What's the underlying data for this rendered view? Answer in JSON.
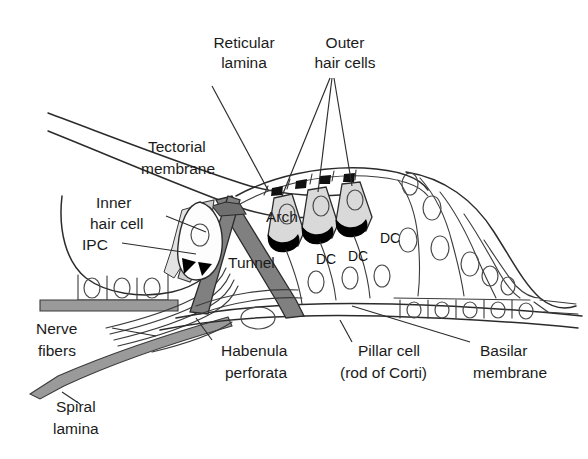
{
  "figure": {
    "background_color": "#ffffff",
    "line_color": "#2b2b2b",
    "fill_gray_dark": "#808080",
    "fill_gray_mid": "#9a9a9a",
    "fill_gray_light": "#d4d4d4",
    "fill_black": "#000000"
  },
  "labels": {
    "reticular_lamina": {
      "line1": "Reticular",
      "line2": "lamina"
    },
    "outer_hair_cells": {
      "line1": "Outer",
      "line2": "hair cells"
    },
    "tectorial_membrane": {
      "line1": "Tectorial",
      "line2": "membrane"
    },
    "inner_hair_cell": {
      "line1": "Inner",
      "line2": "hair cell"
    },
    "ipc": "IPC",
    "arch": "Arch",
    "tunnel": "Tunnel",
    "dc_left": "DC",
    "dc_mid": "DC",
    "dc_right": "DC",
    "nerve_fibers": {
      "line1": "Nerve",
      "line2": "fibers"
    },
    "spiral_lamina": {
      "line1": "Spiral",
      "line2": "lamina"
    },
    "habenula_perforata": {
      "line1": "Habenula",
      "line2": "perforata"
    },
    "pillar_cell": {
      "line1": "Pillar cell",
      "line2": "(rod of Corti)"
    },
    "basilar_membrane": {
      "line1": "Basilar",
      "line2": "membrane"
    }
  }
}
